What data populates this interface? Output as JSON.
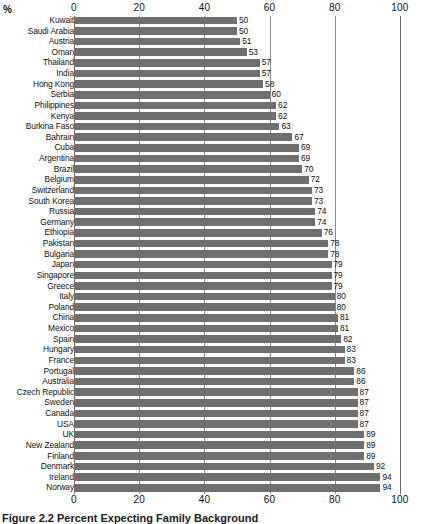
{
  "chart_data": {
    "type": "bar",
    "orientation": "horizontal",
    "title": "",
    "caption": "Figure 2.2  Percent Expecting Family Background",
    "unit_label": "%",
    "xlabel": "",
    "ylabel": "",
    "xlim": [
      0,
      100
    ],
    "xticks": [
      0,
      20,
      40,
      60,
      80,
      100
    ],
    "xtick_labels": [
      "0",
      "20",
      "40",
      "60",
      "80",
      "100"
    ],
    "grid": true,
    "axis_positions": [
      "top",
      "bottom"
    ],
    "legend": null,
    "bar_color": "#6f6f6f",
    "categories": [
      "Kuwait",
      "Saudi Arabia",
      "Austria",
      "Oman",
      "Thailand",
      "India",
      "Hong Kong",
      "Serbia",
      "Philippines",
      "Kenya",
      "Burkina Faso",
      "Bahrain",
      "Cuba",
      "Argentina",
      "Brazil",
      "Belgium",
      "Switzerland",
      "South Korea",
      "Russia",
      "Germany",
      "Ethiopia",
      "Pakistan",
      "Bulgaria",
      "Japan",
      "Singapore",
      "Greece",
      "Italy",
      "Poland",
      "China",
      "Mexico",
      "Spain",
      "Hungary",
      "France",
      "Portugal",
      "Australia",
      "Czech Republic",
      "Sweden",
      "Canada",
      "USA",
      "UK",
      "New Zealand",
      "Finland",
      "Denmark",
      "Ireland",
      "Norway"
    ],
    "values": [
      50,
      50,
      51,
      53,
      57,
      57,
      58,
      60,
      62,
      62,
      63,
      67,
      69,
      69,
      70,
      72,
      73,
      73,
      74,
      74,
      76,
      78,
      78,
      79,
      79,
      79,
      80,
      80,
      81,
      81,
      82,
      83,
      83,
      86,
      86,
      87,
      87,
      87,
      87,
      89,
      89,
      89,
      92,
      94,
      94
    ]
  }
}
